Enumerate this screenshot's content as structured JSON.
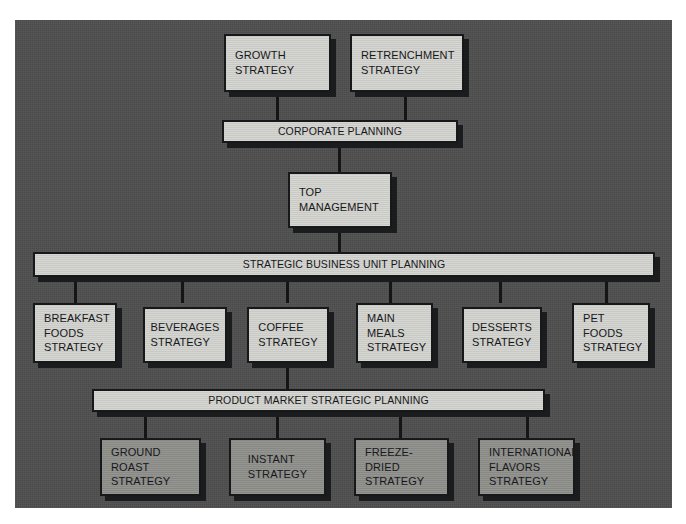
{
  "diagram": {
    "background_color": "#4e4e4e",
    "box_light_color": "#cfcfcb",
    "box_mid_color": "#8d8d8a",
    "outline_color": "#17181a",
    "levels": [
      {
        "name": "corporate-strategy-options",
        "nodes": [
          {
            "id": "growth",
            "label": "GROWTH\nSTRATEGY"
          },
          {
            "id": "retrenchment",
            "label": "RETRENCHMENT\nSTRATEGY"
          }
        ]
      },
      {
        "name": "corporate-planning",
        "nodes": [
          {
            "id": "corporate-planning",
            "label": "CORPORATE PLANNING"
          }
        ]
      },
      {
        "name": "top-management",
        "nodes": [
          {
            "id": "top-management",
            "label": "TOP\nMANAGEMENT"
          }
        ]
      },
      {
        "name": "sbu-planning",
        "nodes": [
          {
            "id": "sbu-planning",
            "label": "STRATEGIC BUSINESS UNIT PLANNING"
          }
        ]
      },
      {
        "name": "business-unit-strategies",
        "nodes": [
          {
            "id": "breakfast-foods",
            "label": "BREAKFAST\nFOODS\nSTRATEGY"
          },
          {
            "id": "beverages",
            "label": "BEVERAGES\nSTRATEGY"
          },
          {
            "id": "coffee",
            "label": "COFFEE\nSTRATEGY"
          },
          {
            "id": "main-meals",
            "label": "MAIN\nMEALS\nSTRATEGY"
          },
          {
            "id": "desserts",
            "label": "DESSERTS\nSTRATEGY"
          },
          {
            "id": "pet-foods",
            "label": "PET\nFOODS\nSTRATEGY"
          }
        ]
      },
      {
        "name": "product-market-planning",
        "nodes": [
          {
            "id": "product-market-planning",
            "label": "PRODUCT MARKET STRATEGIC PLANNING"
          }
        ]
      },
      {
        "name": "product-market-strategies",
        "nodes": [
          {
            "id": "ground-roast",
            "label": "GROUND\nROAST\nSTRATEGY"
          },
          {
            "id": "instant",
            "label": "INSTANT\nSTRATEGY"
          },
          {
            "id": "freeze-dried",
            "label": "FREEZE-\nDRIED\nSTRATEGY"
          },
          {
            "id": "international-flavors",
            "label": "INTERNATIONAL\nFLAVORS\nSTRATEGY"
          }
        ]
      }
    ]
  }
}
